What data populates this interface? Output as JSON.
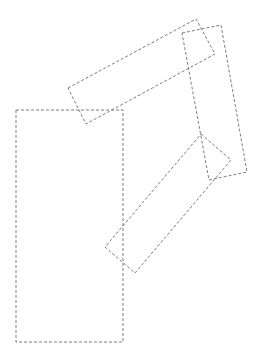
{
  "canvas": {
    "width": 263,
    "height": 358,
    "background": "#ffffff"
  },
  "stroke": {
    "color": "#6e6e6e",
    "dash": "3,2",
    "width": 0.9
  },
  "shapes": [
    {
      "name": "rotated-rect-top",
      "points": "68,88 196,19 215,54 86,124"
    },
    {
      "name": "rotated-rect-right",
      "points": "182,33 221,25 247,172 209,180"
    },
    {
      "name": "rotated-rect-middle",
      "points": "201,134 231,160 135,273 105,247"
    },
    {
      "name": "upright-rect-left",
      "points": "16,110 123,110 123,342 16,342"
    }
  ]
}
